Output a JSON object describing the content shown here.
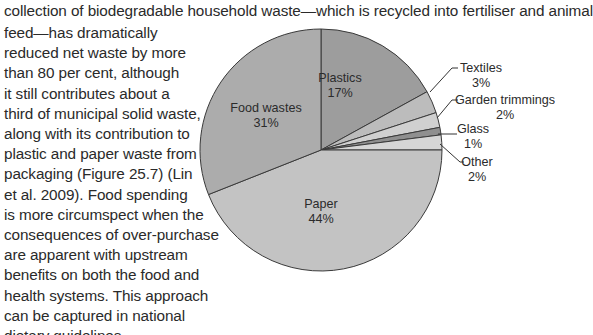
{
  "body_text": {
    "top_line": "collection of biodegradable household waste—which is recycled into fertiliser and animal",
    "column_lines": [
      "feed—has dramatically",
      "reduced net waste by more",
      "than 80 per cent, although",
      "it still contributes about a",
      "third of municipal solid waste,",
      "along with its contribution to",
      "plastic and paper waste from",
      "packaging (Figure 25.7) (Lin",
      "et al. 2009). Food spending",
      "is more circumspect when the",
      "consequences of over-purchase",
      "are apparent with upstream",
      "benefits on both the food and",
      "health systems. This approach",
      "can be captured in national",
      "dietary guidelines."
    ]
  },
  "chart_data": {
    "type": "pie",
    "title": "",
    "start_angle": "12 o'clock",
    "direction": "clockwise",
    "slices": [
      {
        "label": "Plastics",
        "value": 17,
        "value_label": "17%",
        "color": "#9d9d9d",
        "label_position": "inside"
      },
      {
        "label": "Textiles",
        "value": 3,
        "value_label": "3%",
        "color": "#bcbcbc",
        "label_position": "outside"
      },
      {
        "label": "Garden trimmings",
        "value": 2,
        "value_label": "2%",
        "color": "#d0d0d0",
        "label_position": "outside"
      },
      {
        "label": "Glass",
        "value": 1,
        "value_label": "1%",
        "color": "#8f8f8f",
        "label_position": "outside"
      },
      {
        "label": "Other",
        "value": 2,
        "value_label": "2%",
        "color": "#d6d6d6",
        "label_position": "outside"
      },
      {
        "label": "Paper",
        "value": 44,
        "value_label": "44%",
        "color": "#c3c3c3",
        "label_position": "inside"
      },
      {
        "label": "Food wastes",
        "value": 31,
        "value_label": "31%",
        "color": "#acacac",
        "label_position": "inside"
      }
    ],
    "legend": "none (leader-line labels)"
  }
}
